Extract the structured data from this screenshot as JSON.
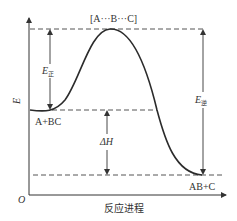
{
  "diagram": {
    "type": "energy-profile",
    "y_axis_label": "E",
    "x_axis_label": "反应进程",
    "origin_label": "O",
    "transition_state_label": "[A···B···C]",
    "reactants_label": "A+BC",
    "products_label": "AB+C",
    "forward_activation": {
      "symbol": "E",
      "subscript": "正"
    },
    "reverse_activation": {
      "symbol": "E",
      "subscript": "逆"
    },
    "enthalpy_change": {
      "symbol": "ΔH"
    },
    "colors": {
      "line": "#2b2b2b",
      "text": "#333333",
      "dash": "#555555"
    }
  }
}
